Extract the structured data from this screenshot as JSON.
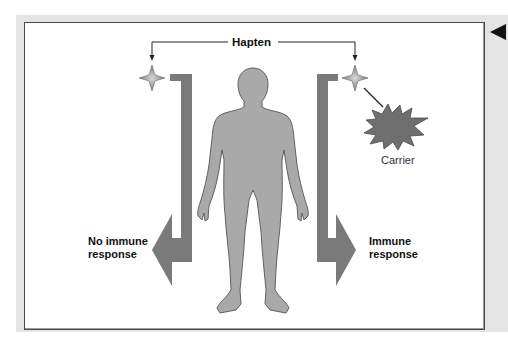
{
  "diagram": {
    "hapten_label": "Hapten",
    "carrier_label": "Carrier",
    "left_outcome": {
      "line1": "No immune",
      "line2": "response"
    },
    "right_outcome": {
      "line1": "Immune",
      "line2": "response"
    },
    "colors": {
      "arrow": "#7a7a7a",
      "body": "#a9a9a9",
      "body_outline": "#555555",
      "carrier": "#6f6f6f",
      "hapten_star": "#8e8e8e",
      "frame_bg": "#e4e4e4",
      "panel_border": "#4a4a4a"
    }
  },
  "navigation": {
    "back_icon": "triangle-left"
  }
}
